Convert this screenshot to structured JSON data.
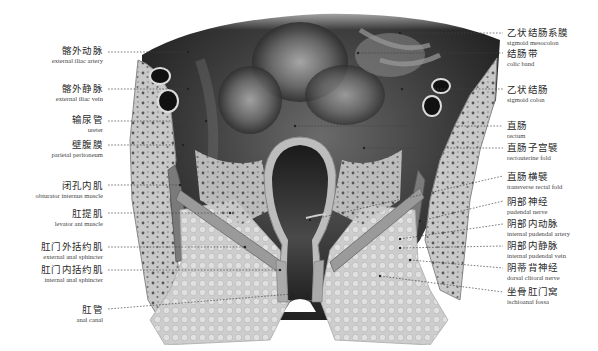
{
  "figure": {
    "colors": {
      "background": "#ffffff",
      "tissue_dark": "#3a3a3a",
      "tissue_light": "#d8d8d8",
      "fat": "#cfcfcf",
      "leader_line": "#444444"
    }
  },
  "labels_left": [
    {
      "zh": "髂外动脉",
      "en": "external iliac artery",
      "x": 103,
      "y": 46,
      "lx1": 108,
      "ly1": 52,
      "lx2": 188,
      "ly2": 52
    },
    {
      "zh": "髂外静脉",
      "en": "external iliac vein",
      "x": 103,
      "y": 84,
      "lx1": 108,
      "ly1": 89,
      "lx2": 188,
      "ly2": 89
    },
    {
      "zh": "输尿管",
      "en": "ureter",
      "x": 103,
      "y": 113,
      "lx1": 108,
      "ly1": 121,
      "lx2": 206,
      "ly2": 121
    },
    {
      "zh": "壁腹膜",
      "en": "parietal peritoneum",
      "x": 103,
      "y": 138,
      "lx1": 108,
      "ly1": 145,
      "lx2": 183,
      "ly2": 145
    },
    {
      "zh": "闭孔内肌",
      "en": "obturator internus muscle",
      "x": 103,
      "y": 181,
      "lx1": 108,
      "ly1": 185,
      "lx2": 180,
      "ly2": 185
    },
    {
      "zh": "肛提肌",
      "en": "levator ani muscle",
      "x": 103,
      "y": 209,
      "lx1": 108,
      "ly1": 213,
      "lx2": 230,
      "ly2": 213
    },
    {
      "zh": "肛门外括约肌",
      "en": "external anal sphincter",
      "x": 103,
      "y": 241,
      "lx1": 108,
      "ly1": 247,
      "lx2": 245,
      "ly2": 247
    },
    {
      "zh": "肛门内括约肌",
      "en": "internal anal sphincter",
      "x": 103,
      "y": 264,
      "lx1": 108,
      "ly1": 270,
      "lx2": 280,
      "ly2": 270
    },
    {
      "zh": "肛管",
      "en": "anal canal",
      "x": 103,
      "y": 306,
      "lx1": 108,
      "ly1": 309,
      "lx2": 292,
      "ly2": 294
    }
  ],
  "labels_right": [
    {
      "zh": "乙状结肠系膜",
      "en": "sigmoid mesocolon",
      "x": 507,
      "y": 29,
      "lx1": 400,
      "ly1": 33,
      "lx2": 503,
      "ly2": 33
    },
    {
      "zh": "结肠带",
      "en": "colic band",
      "x": 507,
      "y": 47,
      "lx1": 358,
      "ly1": 53,
      "lx2": 503,
      "ly2": 53
    },
    {
      "zh": "乙状结肠",
      "en": "sigmoid colon",
      "x": 507,
      "y": 84,
      "lx1": 402,
      "ly1": 89,
      "lx2": 503,
      "ly2": 89
    },
    {
      "zh": "直肠",
      "en": "rectum",
      "x": 507,
      "y": 122,
      "lx1": 295,
      "ly1": 126,
      "lx2": 503,
      "ly2": 126
    },
    {
      "zh": "直肠子宫襞",
      "en": "rectouterine fold",
      "x": 507,
      "y": 143,
      "lx1": 364,
      "ly1": 148,
      "lx2": 503,
      "ly2": 148
    },
    {
      "zh": "直肠横襞",
      "en": "transverse rectal fold",
      "x": 507,
      "y": 172,
      "lx1": 310,
      "ly1": 220,
      "lx2": 503,
      "ly2": 176
    },
    {
      "zh": "阴部神经",
      "en": "pudendal nerve",
      "x": 507,
      "y": 197,
      "lx1": 420,
      "ly1": 221,
      "lx2": 503,
      "ly2": 201
    },
    {
      "zh": "阴部内动脉",
      "en": "internal pudendal artery",
      "x": 507,
      "y": 219,
      "lx1": 400,
      "ly1": 239,
      "lx2": 503,
      "ly2": 224
    },
    {
      "zh": "阴部内静脉",
      "en": "internal pudendal vein",
      "x": 507,
      "y": 241,
      "lx1": 400,
      "ly1": 248,
      "lx2": 503,
      "ly2": 246
    },
    {
      "zh": "阴蒂背神经",
      "en": "dorsal clitoral nerve",
      "x": 507,
      "y": 263,
      "lx1": 410,
      "ly1": 260,
      "lx2": 503,
      "ly2": 268
    },
    {
      "zh": "坐骨肛门窝",
      "en": "ischioanal fossa",
      "x": 507,
      "y": 288,
      "lx1": 380,
      "ly1": 276,
      "lx2": 503,
      "ly2": 292
    }
  ]
}
